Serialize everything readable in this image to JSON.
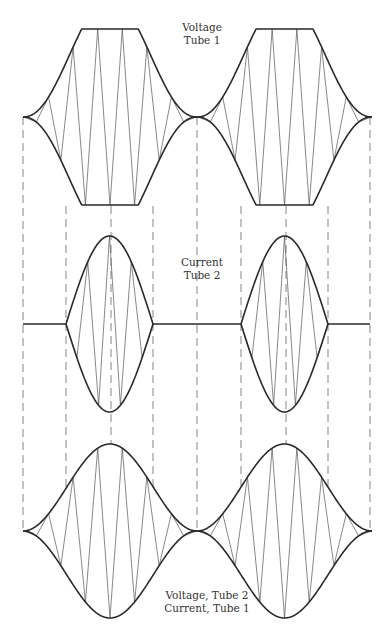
{
  "diagram": {
    "type": "waveform-diagram",
    "stroke_color": "#2a2a2a",
    "fill_line_color": "#555555",
    "guide_color": "#777777",
    "panels": [
      {
        "id": "voltage-tube-1",
        "label_lines": [
          "Voltage",
          "Tube 1"
        ],
        "envelope": "clipped",
        "center_y": 117,
        "top_y": 29,
        "bottom_y": 206
      },
      {
        "id": "current-tube-2",
        "label_lines": [
          "Current",
          "Tube 2"
        ],
        "envelope": "pulses",
        "baseline_y": 324,
        "pulses": [
          {
            "x_start": 66,
            "x_end": 153,
            "peak_top": 236,
            "peak_bottom": 412
          },
          {
            "x_start": 241,
            "x_end": 328,
            "peak_top": 236,
            "peak_bottom": 412
          }
        ]
      },
      {
        "id": "voltage-tube-2-current-tube-1",
        "label_lines": [
          "Voltage, Tube 2",
          "Current, Tube 1"
        ],
        "envelope": "bell",
        "center_y": 531,
        "top_y": 444,
        "bottom_y": 619
      }
    ],
    "guide_lines_x": [
      23,
      66,
      111,
      153,
      197,
      241,
      286,
      328,
      370
    ],
    "cycle_boundaries_x": [
      23,
      197,
      372
    ]
  }
}
